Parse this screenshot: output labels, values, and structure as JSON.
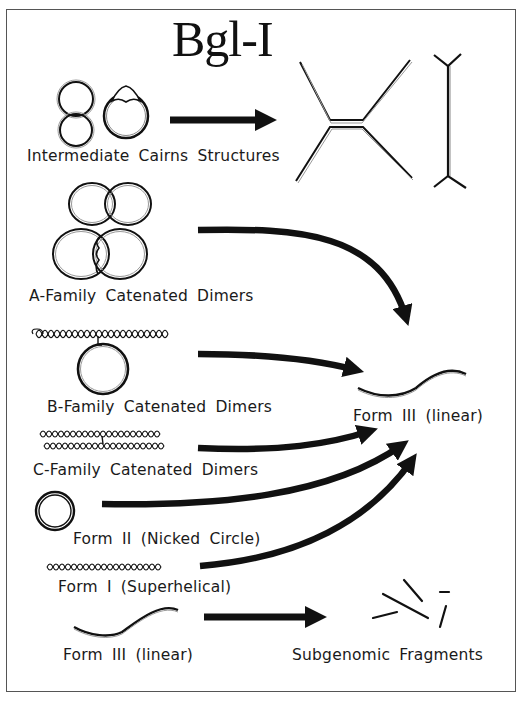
{
  "title": "Bgl-I",
  "nodes": {
    "cairns": {
      "label": "Intermediate Cairns Structures"
    },
    "a_family": {
      "label": "A-Family Catenated Dimers"
    },
    "b_family": {
      "label": "B-Family Catenated Dimers"
    },
    "c_family": {
      "label": "C-Family Catenated Dimers"
    },
    "form_ii": {
      "label": "Form II (Nicked Circle)"
    },
    "form_i": {
      "label": "Form I (Superhelical)"
    },
    "form_iii_source": {
      "label": "Form III (linear)"
    },
    "form_iii_target": {
      "label": "Form III (linear)"
    },
    "subgenomic": {
      "label": "Subgenomic Fragments"
    }
  },
  "edges": [
    {
      "from": "cairns",
      "to": "branched-replication-intermediates"
    },
    {
      "from": "a_family",
      "to": "form_iii_target"
    },
    {
      "from": "b_family",
      "to": "form_iii_target"
    },
    {
      "from": "c_family",
      "to": "form_iii_target"
    },
    {
      "from": "form_ii",
      "to": "form_iii_target"
    },
    {
      "from": "form_i",
      "to": "form_iii_target"
    },
    {
      "from": "form_iii_source",
      "to": "subgenomic"
    }
  ],
  "colors": {
    "ink": "#111111",
    "frame": "#555555",
    "background": "#ffffff"
  }
}
